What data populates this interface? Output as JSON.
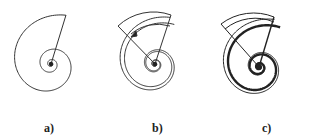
{
  "figure": {
    "panels": [
      {
        "id": "a",
        "label": "a)",
        "center": [
          51,
          64
        ],
        "style": "single thin spiral with one radial line"
      },
      {
        "id": "b",
        "label": "b)",
        "center": [
          155,
          64
        ],
        "style": "double thin spiral with two radial lines and arrow"
      },
      {
        "id": "c",
        "label": "c)",
        "center": [
          259,
          67
        ],
        "style": "bold spiral paired with thin spiral and two radial lines"
      }
    ],
    "colors": {
      "stroke": "#333333",
      "background": "#ffffff"
    }
  }
}
